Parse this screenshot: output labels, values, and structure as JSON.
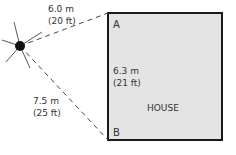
{
  "diagram": {
    "house": {
      "label": "HOUSE",
      "corner_a": "A",
      "corner_b": "B",
      "side_length_m": "6.3 m",
      "side_length_ft": "(21 ft)",
      "fill": "#e4e4e4",
      "stroke": "#1a1a1a"
    },
    "point": {
      "distance_to_a_m": "6.0 m",
      "distance_to_a_ft": "(20 ft)",
      "distance_to_b_m": "7.5 m",
      "distance_to_b_ft": "(25 ft)"
    }
  }
}
